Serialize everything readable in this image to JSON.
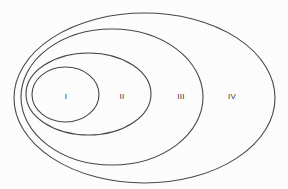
{
  "diagram": {
    "type": "nested-ellipses",
    "line_color": "#474747",
    "label_color": "#333333",
    "background_color": "#fcfcfc",
    "regions": [
      {
        "id": "I",
        "label": "I",
        "cx": 65.5,
        "cy": 94.5,
        "rx": 33.5,
        "ry": 27.5,
        "label_x": 66,
        "label_y": 97
      },
      {
        "id": "II",
        "label": "II",
        "cx": 88.5,
        "cy": 94,
        "rx": 62.5,
        "ry": 41,
        "label_x": 122,
        "label_y": 97
      },
      {
        "id": "III",
        "label": "III",
        "cx": 112,
        "cy": 97,
        "rx": 91,
        "ry": 68,
        "label_x": 181,
        "label_y": 97
      },
      {
        "id": "IV",
        "label": "IV",
        "cx": 144.5,
        "cy": 98,
        "rx": 130.5,
        "ry": 85,
        "label_x": 232,
        "label_y": 97
      }
    ]
  }
}
